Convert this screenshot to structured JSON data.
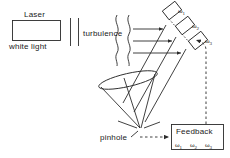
{
  "figure": {
    "width": 230,
    "height": 158,
    "background": "#ffffff",
    "stroke_color": "#2b2b2b"
  },
  "labels": {
    "laser": "Laser",
    "white_light": "white light",
    "turbulence": "turbulence",
    "pinhole": "pinhole",
    "feedback": "Feedback"
  },
  "detectors": [
    {
      "id": "detector-1",
      "omega": "ω",
      "sub": "1"
    },
    {
      "id": "detector-2",
      "omega": "ω",
      "sub": "2"
    },
    {
      "id": "detector-3",
      "omega": "ω",
      "sub": "3"
    }
  ],
  "feedback_channels": [
    {
      "id": "feedback-omega-1",
      "omega": "ω",
      "sub": "1"
    },
    {
      "id": "feedback-omega-2",
      "omega": "ω",
      "sub": "2"
    },
    {
      "id": "feedback-omega-3",
      "omega": "ω",
      "sub": "3"
    }
  ]
}
